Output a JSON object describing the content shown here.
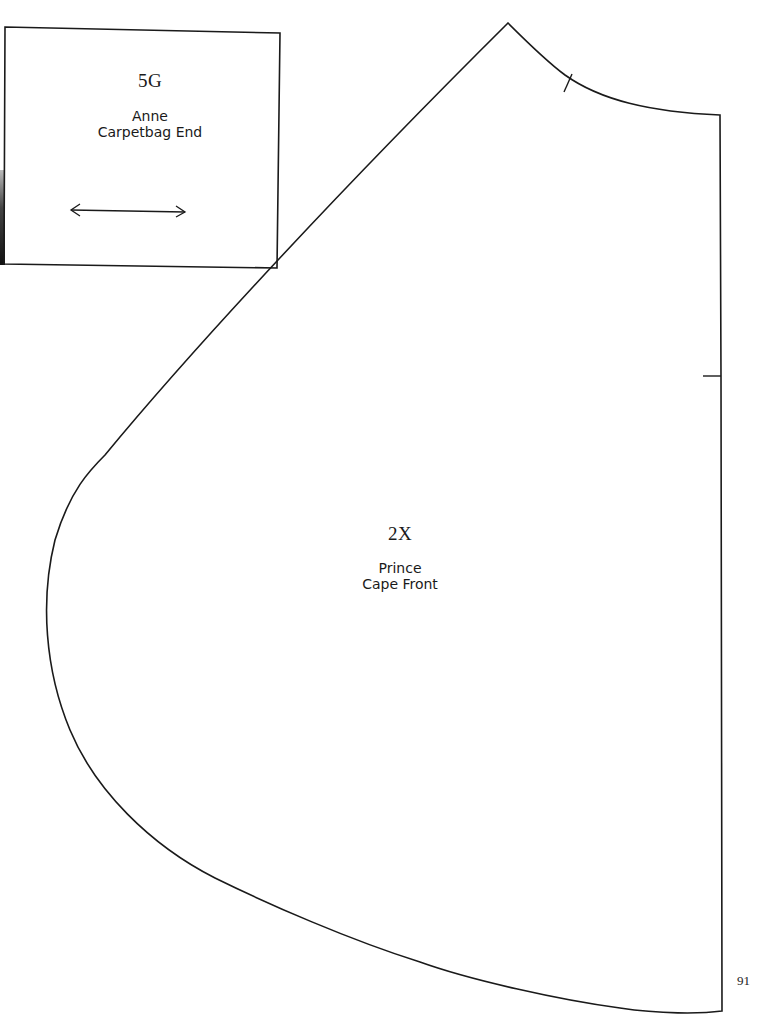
{
  "pieces": [
    {
      "code": "5G",
      "name_line1": "Anne",
      "name_line2": "Carpetbag End",
      "grainline": "double-arrow-horizontal"
    },
    {
      "code": "2X",
      "name_line1": "Prince",
      "name_line2": "Cape Front"
    }
  ],
  "page_number": "91",
  "colors": {
    "line": "#1a1a1a",
    "paper": "#ffffff"
  }
}
